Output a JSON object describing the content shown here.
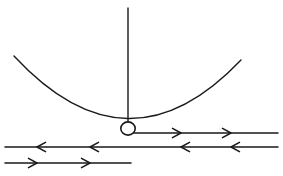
{
  "figure": {
    "kind": "line-diagram",
    "background_color": "#ffffff",
    "ink_color": "#1a1a1a",
    "width": 283,
    "height": 176
  },
  "elements": {
    "support_string": {
      "name": "vertical pendulum string",
      "x": 128,
      "y_top": 8,
      "y_bottom": 122,
      "stroke_width": 1.4
    },
    "bob": {
      "name": "pendulum bob",
      "cx": 128,
      "cy": 128.5,
      "rx": 7.2,
      "ry": 6.6,
      "stroke_width": 1.6,
      "fill": "#ffffff"
    },
    "arc": {
      "name": "concave curved track",
      "start_x": 14,
      "start_y": 56,
      "end_x": 241,
      "end_y": 60,
      "control_x": 128,
      "control_y": 179,
      "stroke_width": 1.4
    }
  },
  "vector_lines": [
    {
      "id": "line-1",
      "name": "upper rightward vector line",
      "y": 133,
      "x_start": 134,
      "x_end": 278,
      "direction": "right",
      "stroke_width": 1.5,
      "arrows": [
        {
          "x": 181,
          "direction": "right"
        },
        {
          "x": 231,
          "direction": "right"
        }
      ]
    },
    {
      "id": "line-2",
      "name": "middle leftward vector line",
      "y": 147,
      "x_start": 5,
      "x_end": 278,
      "direction": "left",
      "stroke_width": 1.5,
      "arrows": [
        {
          "x": 37,
          "direction": "left"
        },
        {
          "x": 90,
          "direction": "left"
        },
        {
          "x": 181,
          "direction": "left"
        },
        {
          "x": 231,
          "direction": "left"
        }
      ]
    },
    {
      "id": "line-3",
      "name": "lower rightward vector line",
      "y": 163,
      "x_start": 5,
      "x_end": 131,
      "direction": "right",
      "stroke_width": 1.5,
      "arrows": [
        {
          "x": 37,
          "direction": "right"
        },
        {
          "x": 90,
          "direction": "right"
        }
      ]
    }
  ],
  "labels": {
    "visible_text": []
  }
}
